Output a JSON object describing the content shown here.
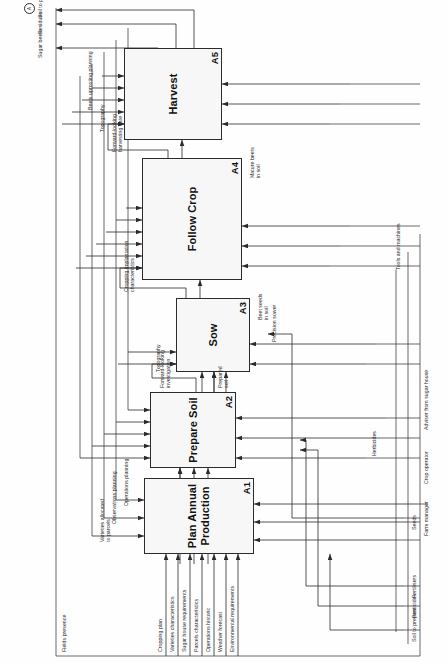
{
  "diagram": {
    "kind": "IDEF0 activity model",
    "orientation": "rotated-90",
    "frame_label": "",
    "tunnel_marker": "A"
  },
  "nodes": [
    {
      "id": "A1",
      "code": "A1",
      "title": "Plan Annual\nProduction"
    },
    {
      "id": "A2",
      "code": "A2",
      "title": "Prepare Soil"
    },
    {
      "id": "A3",
      "code": "A3",
      "title": "Sow"
    },
    {
      "id": "A4",
      "code": "A4",
      "title": "Follow Crop"
    },
    {
      "id": "A5",
      "code": "A5",
      "title": "Harvest"
    }
  ],
  "external_inputs": [
    {
      "id": "in-soil-to-prepare",
      "label": "Soil to prepare"
    },
    {
      "id": "in-pesticides",
      "label": "Pesticides"
    },
    {
      "id": "in-fertilisers",
      "label": "Fertilisers"
    },
    {
      "id": "in-seeds",
      "label": "Seeds"
    }
  ],
  "external_controls": [
    {
      "id": "ctl-cropping-plan",
      "label": "Cropping plan"
    },
    {
      "id": "ctl-varieties-characteristics",
      "label": "Varieties characteristics"
    },
    {
      "id": "ctl-sugar-house-requirements",
      "label": "Sugar house requirements"
    },
    {
      "id": "ctl-parcels-characteristics",
      "label": "Parcels characteristics"
    },
    {
      "id": "ctl-operations-historic",
      "label": "Operations historic"
    },
    {
      "id": "ctl-weather-forecast",
      "label": "Weather forecast"
    },
    {
      "id": "ctl-environmental-requirements",
      "label": "Environmental requirements"
    },
    {
      "id": "ctl-fields-presence",
      "label": "Fields presence"
    },
    {
      "id": "ctl-topography-sow",
      "label": "Topography"
    },
    {
      "id": "ctl-topography-harvest",
      "label": "Topography"
    },
    {
      "id": "ctl-beets-uprooting-planning",
      "label": "Beets uprooting planning"
    }
  ],
  "external_mechanisms": [
    {
      "id": "mech-herbicides",
      "label": "Herbicides"
    },
    {
      "id": "mech-precision-sower",
      "label": "Precision sower"
    },
    {
      "id": "mech-tools-and-machines",
      "label": "Tools and machines"
    },
    {
      "id": "mech-farm-manager",
      "label": "Farm manager"
    },
    {
      "id": "mech-crop-operator",
      "label": "Crop operator"
    },
    {
      "id": "mech-adviser-sugar-house",
      "label": "Adviser from sugar house"
    }
  ],
  "external_outputs": [
    {
      "id": "out-sugar-beets",
      "label": "Sugar beets"
    },
    {
      "id": "out-residues",
      "label": "Residues"
    },
    {
      "id": "out-soil-to-prepare",
      "label": "Soil to prepare"
    }
  ],
  "internal_flows": [
    {
      "id": "flow-varieties-allocated",
      "label": "Varieties allocated\nto parcels",
      "from": "A1",
      "to": "A2"
    },
    {
      "id": "flow-observations-planning",
      "label": "Observations planning",
      "from": "A1",
      "to": "A4"
    },
    {
      "id": "flow-operations-planning",
      "label": "Operations planning",
      "from": "A1",
      "to": "A2"
    },
    {
      "id": "flow-forward-looking-investigation",
      "label": "Forward-looking\ninvestigation",
      "from": "A2",
      "to": "A3"
    },
    {
      "id": "flow-prepared-soil",
      "label": "Prepared\nsoil",
      "from": "A2",
      "to": "A3"
    },
    {
      "id": "flow-beet-seeds-in-soil",
      "label": "Beet seeds\nin soil",
      "from": "A3",
      "to": "A4"
    },
    {
      "id": "flow-cropping-implantation",
      "label": "Cropping implantation\ncharacteristics",
      "from": "A3",
      "to": "A4"
    },
    {
      "id": "flow-forward-looking-harvesting-date",
      "label": "Forward-looking\nharvesting date",
      "from": "A4",
      "to": "A5"
    },
    {
      "id": "flow-mature-beets-in-soil",
      "label": "Mature beets\nin soil",
      "from": "A4",
      "to": "A5"
    }
  ]
}
